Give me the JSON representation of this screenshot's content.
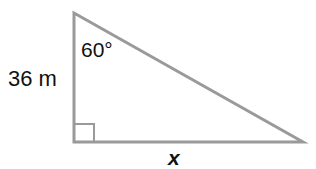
{
  "diagram": {
    "type": "right-triangle",
    "labels": {
      "left_side": "36 m",
      "top_angle": "60°",
      "bottom_side": "x"
    },
    "right_angle_at": "bottom-left",
    "colors": {
      "stroke": "#9a9a9a",
      "text": "#111111",
      "background": "#ffffff"
    }
  }
}
